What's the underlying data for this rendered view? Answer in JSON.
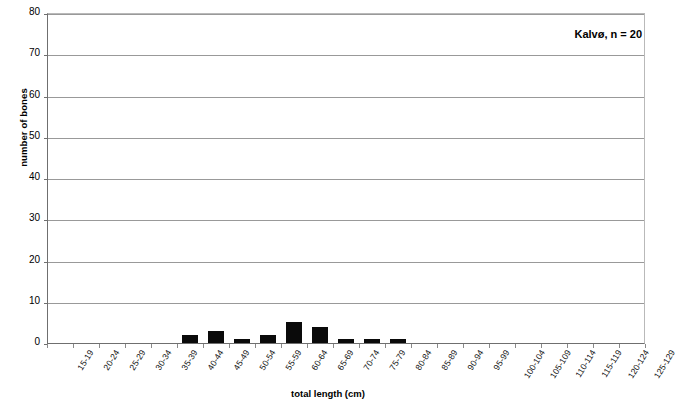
{
  "chart_data": {
    "type": "bar",
    "title": "",
    "annotation": "Kalvø, n = 20",
    "xlabel": "total length (cm)",
    "ylabel": "number of bones",
    "ylim": [
      0,
      80
    ],
    "ytick_step": 10,
    "yticks": [
      0,
      10,
      20,
      30,
      40,
      50,
      60,
      70,
      80
    ],
    "grid": true,
    "grid_axis": "y",
    "legend": false,
    "bar_color": "#0a0a0a",
    "categories": [
      "15-19",
      "20-24",
      "25-29",
      "30-34",
      "35-39",
      "40-44",
      "45-49",
      "50-54",
      "55-59",
      "60-64",
      "65-69",
      "70-74",
      "75-79",
      "80-84",
      "85-89",
      "90-94",
      "95-99",
      "100-104",
      "105-109",
      "110-114",
      "115-119",
      "120-124",
      "125-129"
    ],
    "values": [
      0,
      0,
      0,
      0,
      0,
      2,
      3,
      1,
      2,
      5,
      4,
      1,
      1,
      1,
      0,
      0,
      0,
      0,
      0,
      0,
      0,
      0,
      0
    ],
    "total": 20
  }
}
